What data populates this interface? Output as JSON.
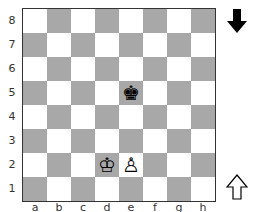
{
  "board": {
    "files": [
      "a",
      "b",
      "c",
      "d",
      "e",
      "f",
      "g",
      "h"
    ],
    "ranks": [
      "8",
      "7",
      "6",
      "5",
      "4",
      "3",
      "2",
      "1"
    ],
    "colors": {
      "light": "#ffffff",
      "dark": "#a8a8a8"
    },
    "pieces": [
      {
        "square": "e5",
        "piece": "black-king",
        "glyph": "♚"
      },
      {
        "square": "d2",
        "piece": "white-king",
        "glyph": "♔"
      },
      {
        "square": "e2",
        "piece": "white-pawn",
        "glyph": "♙"
      }
    ]
  },
  "indicators": {
    "black_side_arrow": "filled-down-arrow",
    "white_side_arrow": "outline-up-arrow",
    "to_move": "black"
  }
}
